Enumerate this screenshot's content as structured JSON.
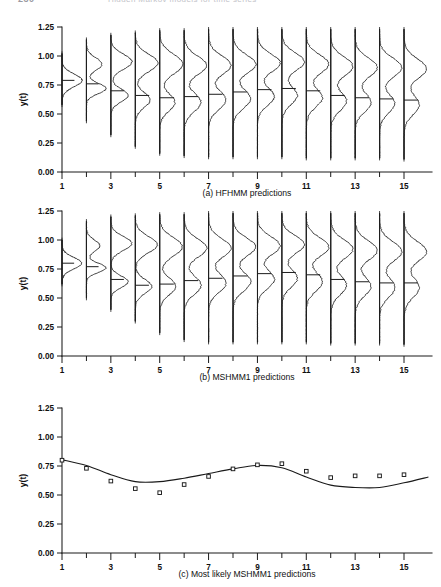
{
  "page_header": {
    "page_number": "230",
    "running_title": "Hidden Markov models for time series"
  },
  "figure": {
    "y_axis_label": "y(t)",
    "y_ticks": [
      "0.00",
      "0.25",
      "0.50",
      "0.75",
      "1.00",
      "1.25"
    ],
    "y_tick_values": [
      0.0,
      0.25,
      0.5,
      0.75,
      1.0,
      1.25
    ],
    "x_ticks_all": [
      1,
      2,
      3,
      4,
      5,
      6,
      7,
      8,
      9,
      10,
      11,
      12,
      13,
      14,
      15
    ],
    "x_tick_labels": [
      "1",
      "",
      "3",
      "",
      "5",
      "",
      "7",
      "",
      "9",
      "",
      "11",
      "",
      "13",
      "",
      "15"
    ],
    "panels": [
      {
        "id": "a",
        "caption": "(a) HFHMM predictions",
        "type": "density-strip"
      },
      {
        "id": "b",
        "caption": "(b) MSHMM1 predictions",
        "type": "density-strip"
      },
      {
        "id": "c",
        "caption": "(c) Most likely MSHMM1 predictions",
        "type": "line-scatter"
      }
    ]
  },
  "chart_data": [
    {
      "type": "area",
      "panel": "a",
      "title": "(a) HFHMM predictions",
      "xlabel": "",
      "ylabel": "y(t)",
      "xlim": [
        0.5,
        16.0
      ],
      "ylim": [
        0.0,
        1.25
      ],
      "grid": false,
      "legend": "none",
      "note": "Sideways predictive density for y(t) drawn at each time t, with a horizontal median bar.",
      "x": [
        1,
        2,
        3,
        4,
        5,
        6,
        7,
        8,
        9,
        10,
        11,
        12,
        13,
        14,
        15
      ],
      "medians": [
        0.79,
        0.76,
        0.7,
        0.66,
        0.64,
        0.65,
        0.67,
        0.69,
        0.71,
        0.72,
        0.7,
        0.66,
        0.64,
        0.63,
        0.62
      ],
      "densities": [
        {
          "t": 1,
          "modes": [
            {
              "center": 0.79,
              "sd": 0.055,
              "weight": 1.0
            }
          ],
          "spread_top": 1.02,
          "spread_bottom": 0.58,
          "width": 0.82
        },
        {
          "t": 2,
          "modes": [
            {
              "center": 0.93,
              "sd": 0.055,
              "weight": 0.62
            },
            {
              "center": 0.72,
              "sd": 0.045,
              "weight": 0.78
            }
          ],
          "spread_top": 1.14,
          "spread_bottom": 0.44,
          "width": 0.8
        },
        {
          "t": 3,
          "modes": [
            {
              "center": 0.95,
              "sd": 0.065,
              "weight": 0.8
            },
            {
              "center": 0.66,
              "sd": 0.055,
              "weight": 0.66
            }
          ],
          "spread_top": 1.18,
          "spread_bottom": 0.32,
          "width": 0.86
        },
        {
          "t": 4,
          "modes": [
            {
              "center": 0.94,
              "sd": 0.075,
              "weight": 0.92
            },
            {
              "center": 0.62,
              "sd": 0.065,
              "weight": 0.6
            }
          ],
          "spread_top": 1.2,
          "spread_bottom": 0.22,
          "width": 0.92
        },
        {
          "t": 5,
          "modes": [
            {
              "center": 0.93,
              "sd": 0.085,
              "weight": 0.95
            },
            {
              "center": 0.6,
              "sd": 0.075,
              "weight": 0.62
            }
          ],
          "spread_top": 1.22,
          "spread_bottom": 0.16,
          "width": 0.95
        },
        {
          "t": 6,
          "modes": [
            {
              "center": 0.92,
              "sd": 0.08,
              "weight": 0.88
            },
            {
              "center": 0.6,
              "sd": 0.08,
              "weight": 0.66
            }
          ],
          "spread_top": 1.22,
          "spread_bottom": 0.14,
          "width": 0.92
        },
        {
          "t": 7,
          "modes": [
            {
              "center": 0.92,
              "sd": 0.08,
              "weight": 0.9
            },
            {
              "center": 0.62,
              "sd": 0.08,
              "weight": 0.7
            }
          ],
          "spread_top": 1.23,
          "spread_bottom": 0.13,
          "width": 0.92
        },
        {
          "t": 8,
          "modes": [
            {
              "center": 0.93,
              "sd": 0.08,
              "weight": 0.92
            },
            {
              "center": 0.63,
              "sd": 0.08,
              "weight": 0.72
            }
          ],
          "spread_top": 1.23,
          "spread_bottom": 0.13,
          "width": 0.93
        },
        {
          "t": 9,
          "modes": [
            {
              "center": 0.94,
              "sd": 0.078,
              "weight": 0.95
            },
            {
              "center": 0.65,
              "sd": 0.078,
              "weight": 0.7
            }
          ],
          "spread_top": 1.23,
          "spread_bottom": 0.13,
          "width": 0.93
        },
        {
          "t": 10,
          "modes": [
            {
              "center": 0.95,
              "sd": 0.078,
              "weight": 0.96
            },
            {
              "center": 0.66,
              "sd": 0.078,
              "weight": 0.66
            }
          ],
          "spread_top": 1.23,
          "spread_bottom": 0.13,
          "width": 0.92
        },
        {
          "t": 11,
          "modes": [
            {
              "center": 0.93,
              "sd": 0.08,
              "weight": 0.92
            },
            {
              "center": 0.64,
              "sd": 0.08,
              "weight": 0.66
            }
          ],
          "spread_top": 1.23,
          "spread_bottom": 0.12,
          "width": 0.92
        },
        {
          "t": 12,
          "modes": [
            {
              "center": 0.91,
              "sd": 0.082,
              "weight": 0.9
            },
            {
              "center": 0.61,
              "sd": 0.082,
              "weight": 0.64
            }
          ],
          "spread_top": 1.23,
          "spread_bottom": 0.12,
          "width": 0.91
        },
        {
          "t": 13,
          "modes": [
            {
              "center": 0.9,
              "sd": 0.082,
              "weight": 0.9
            },
            {
              "center": 0.6,
              "sd": 0.082,
              "weight": 0.64
            }
          ],
          "spread_top": 1.23,
          "spread_bottom": 0.12,
          "width": 0.91
        },
        {
          "t": 14,
          "modes": [
            {
              "center": 0.9,
              "sd": 0.082,
              "weight": 0.92
            },
            {
              "center": 0.59,
              "sd": 0.082,
              "weight": 0.62
            }
          ],
          "spread_top": 1.23,
          "spread_bottom": 0.12,
          "width": 0.91
        },
        {
          "t": 15,
          "modes": [
            {
              "center": 0.89,
              "sd": 0.085,
              "weight": 0.92
            },
            {
              "center": 0.58,
              "sd": 0.085,
              "weight": 0.62
            }
          ],
          "spread_top": 1.23,
          "spread_bottom": 0.11,
          "width": 0.92
        }
      ]
    },
    {
      "type": "area",
      "panel": "b",
      "title": "(b) MSHMM1 predictions",
      "xlabel": "",
      "ylabel": "y(t)",
      "xlim": [
        0.5,
        16.0
      ],
      "ylim": [
        0.0,
        1.25
      ],
      "grid": false,
      "legend": "none",
      "note": "Sideways predictive density for y(t) drawn at each time t, with a horizontal median bar.",
      "x": [
        1,
        2,
        3,
        4,
        5,
        6,
        7,
        8,
        9,
        10,
        11,
        12,
        13,
        14,
        15
      ],
      "medians": [
        0.8,
        0.77,
        0.66,
        0.61,
        0.62,
        0.65,
        0.67,
        0.69,
        0.71,
        0.72,
        0.7,
        0.66,
        0.64,
        0.63,
        0.63
      ],
      "densities": [
        {
          "t": 1,
          "modes": [
            {
              "center": 0.8,
              "sd": 0.05,
              "weight": 1.0
            }
          ],
          "spread_top": 1.0,
          "spread_bottom": 0.62,
          "width": 0.8
        },
        {
          "t": 2,
          "modes": [
            {
              "center": 0.95,
              "sd": 0.05,
              "weight": 0.6
            },
            {
              "center": 0.76,
              "sd": 0.04,
              "weight": 0.88
            }
          ],
          "spread_top": 1.16,
          "spread_bottom": 0.5,
          "width": 0.8
        },
        {
          "t": 3,
          "modes": [
            {
              "center": 0.97,
              "sd": 0.06,
              "weight": 0.86
            },
            {
              "center": 0.64,
              "sd": 0.05,
              "weight": 0.7
            }
          ],
          "spread_top": 1.2,
          "spread_bottom": 0.4,
          "width": 0.86
        },
        {
          "t": 4,
          "modes": [
            {
              "center": 0.96,
              "sd": 0.07,
              "weight": 0.92
            },
            {
              "center": 0.6,
              "sd": 0.06,
              "weight": 0.68
            }
          ],
          "spread_top": 1.21,
          "spread_bottom": 0.3,
          "width": 0.9
        },
        {
          "t": 5,
          "modes": [
            {
              "center": 0.94,
              "sd": 0.08,
              "weight": 0.94
            },
            {
              "center": 0.6,
              "sd": 0.072,
              "weight": 0.66
            }
          ],
          "spread_top": 1.22,
          "spread_bottom": 0.2,
          "width": 0.93
        },
        {
          "t": 6,
          "modes": [
            {
              "center": 0.93,
              "sd": 0.08,
              "weight": 0.9
            },
            {
              "center": 0.61,
              "sd": 0.078,
              "weight": 0.68
            }
          ],
          "spread_top": 1.22,
          "spread_bottom": 0.14,
          "width": 0.92
        },
        {
          "t": 7,
          "modes": [
            {
              "center": 0.93,
              "sd": 0.08,
              "weight": 0.9
            },
            {
              "center": 0.63,
              "sd": 0.08,
              "weight": 0.7
            }
          ],
          "spread_top": 1.23,
          "spread_bottom": 0.12,
          "width": 0.92
        },
        {
          "t": 8,
          "modes": [
            {
              "center": 0.94,
              "sd": 0.078,
              "weight": 0.92
            },
            {
              "center": 0.64,
              "sd": 0.08,
              "weight": 0.72
            }
          ],
          "spread_top": 1.23,
          "spread_bottom": 0.12,
          "width": 0.93
        },
        {
          "t": 9,
          "modes": [
            {
              "center": 0.95,
              "sd": 0.078,
              "weight": 0.94
            },
            {
              "center": 0.66,
              "sd": 0.078,
              "weight": 0.7
            }
          ],
          "spread_top": 1.23,
          "spread_bottom": 0.12,
          "width": 0.93
        },
        {
          "t": 10,
          "modes": [
            {
              "center": 0.96,
              "sd": 0.076,
              "weight": 0.96
            },
            {
              "center": 0.67,
              "sd": 0.078,
              "weight": 0.66
            }
          ],
          "spread_top": 1.23,
          "spread_bottom": 0.12,
          "width": 0.92
        },
        {
          "t": 11,
          "modes": [
            {
              "center": 0.94,
              "sd": 0.08,
              "weight": 0.92
            },
            {
              "center": 0.64,
              "sd": 0.08,
              "weight": 0.66
            }
          ],
          "spread_top": 1.23,
          "spread_bottom": 0.12,
          "width": 0.92
        },
        {
          "t": 12,
          "modes": [
            {
              "center": 0.92,
              "sd": 0.082,
              "weight": 0.9
            },
            {
              "center": 0.61,
              "sd": 0.082,
              "weight": 0.64
            }
          ],
          "spread_top": 1.23,
          "spread_bottom": 0.11,
          "width": 0.91
        },
        {
          "t": 13,
          "modes": [
            {
              "center": 0.91,
              "sd": 0.082,
              "weight": 0.9
            },
            {
              "center": 0.6,
              "sd": 0.082,
              "weight": 0.64
            }
          ],
          "spread_top": 1.23,
          "spread_bottom": 0.11,
          "width": 0.91
        },
        {
          "t": 14,
          "modes": [
            {
              "center": 0.9,
              "sd": 0.084,
              "weight": 0.9
            },
            {
              "center": 0.59,
              "sd": 0.084,
              "weight": 0.62
            }
          ],
          "spread_top": 1.23,
          "spread_bottom": 0.11,
          "width": 0.91
        },
        {
          "t": 15,
          "modes": [
            {
              "center": 0.9,
              "sd": 0.085,
              "weight": 0.92
            },
            {
              "center": 0.59,
              "sd": 0.085,
              "weight": 0.62
            }
          ],
          "spread_top": 1.23,
          "spread_bottom": 0.1,
          "width": 0.92
        }
      ]
    },
    {
      "type": "line",
      "panel": "c",
      "title": "(c) Most likely MSHMM1 predictions",
      "xlabel": "",
      "ylabel": "y(t)",
      "xlim": [
        0.5,
        16.0
      ],
      "ylim": [
        0.0,
        1.25
      ],
      "grid": false,
      "legend": "none",
      "x": [
        1,
        2,
        3,
        4,
        5,
        6,
        7,
        8,
        9,
        10,
        11,
        12,
        13,
        14,
        15
      ],
      "series": [
        {
          "name": "observed",
          "marker": "open-square",
          "values": [
            0.8,
            0.73,
            0.62,
            0.555,
            0.52,
            0.59,
            0.66,
            0.725,
            0.76,
            0.77,
            0.705,
            0.65,
            0.665,
            0.665,
            0.675
          ]
        },
        {
          "name": "most likely prediction",
          "marker": "none",
          "values": [
            0.805,
            0.755,
            0.675,
            0.615,
            0.615,
            0.645,
            0.685,
            0.725,
            0.755,
            0.735,
            0.655,
            0.585,
            0.565,
            0.565,
            0.605
          ],
          "extends_to": 16.0,
          "end_value": 0.655
        }
      ]
    }
  ]
}
